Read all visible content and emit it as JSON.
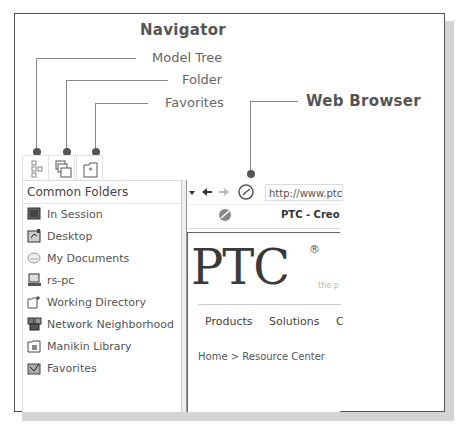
{
  "callouts": {
    "navigator": "Navigator",
    "model_tree": "Model Tree",
    "folder": "Folder",
    "favorites": "Favorites",
    "web_browser": "Web Browser"
  },
  "navigator": {
    "tabs": [
      {
        "name": "model-tree-tab",
        "icon": "model-tree-icon"
      },
      {
        "name": "folder-tab",
        "icon": "folder-icon"
      },
      {
        "name": "favorites-tab",
        "icon": "favorites-icon"
      }
    ],
    "header": "Common Folders",
    "items": [
      {
        "label": "In Session",
        "icon": "in-session-icon"
      },
      {
        "label": "Desktop",
        "icon": "desktop-icon"
      },
      {
        "label": "My Documents",
        "icon": "my-documents-icon"
      },
      {
        "label": "rs-pc",
        "icon": "computer-icon"
      },
      {
        "label": "Working Directory",
        "icon": "working-directory-icon"
      },
      {
        "label": "Network Neighborhood",
        "icon": "network-icon"
      },
      {
        "label": "Manikin Library",
        "icon": "manikin-library-icon"
      },
      {
        "label": "Favorites",
        "icon": "favorites-folder-icon"
      }
    ]
  },
  "browser": {
    "url": "http://www.ptc.",
    "tab_title": "PTC - Creo",
    "page": {
      "logo": "PTC",
      "registered": "®",
      "tagline": "the p",
      "menu": [
        "Products",
        "Solutions",
        "C"
      ],
      "breadcrumb": "Home > Resource Center"
    }
  }
}
